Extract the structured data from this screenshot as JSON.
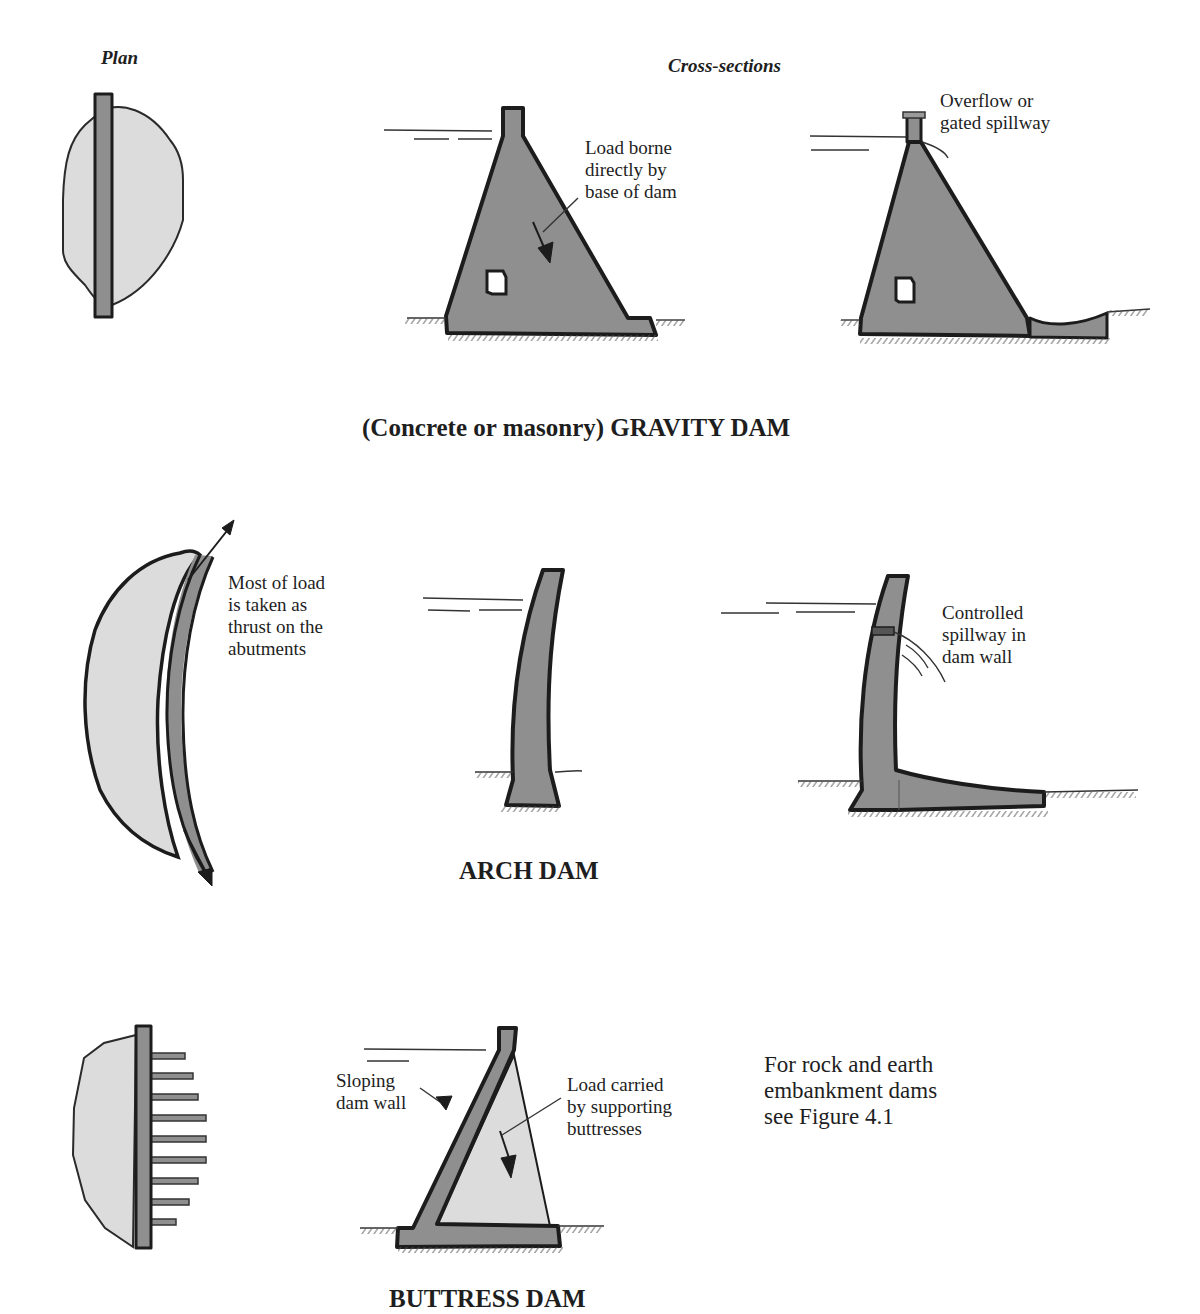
{
  "headers": {
    "plan": "Plan",
    "cross_sections": "Cross-sections"
  },
  "gravity_dam": {
    "caption": "(Concrete or masonry) GRAVITY DAM",
    "annotations": {
      "load": "Load borne\ndirectly by\nbase of dam",
      "spillway": "Overflow or\ngated spillway"
    }
  },
  "arch_dam": {
    "caption": "ARCH DAM",
    "annotations": {
      "thrust": "Most of load\nis taken as\nthrust on the\nabutments",
      "spillway": "Controlled\nspillway in\ndam wall"
    }
  },
  "buttress_dam": {
    "caption": "BUTTRESS DAM",
    "annotations": {
      "sloping_wall": "Sloping\ndam wall",
      "load": "Load carried\nby supporting\nbuttresses"
    },
    "buttress_count": 9
  },
  "footnote": "For rock and earth\nembankment dams\nsee Figure 4.1",
  "colors": {
    "concrete": "#8f8f8f",
    "reservoir": "#dcdcdc",
    "outline": "#1c1c1c"
  }
}
